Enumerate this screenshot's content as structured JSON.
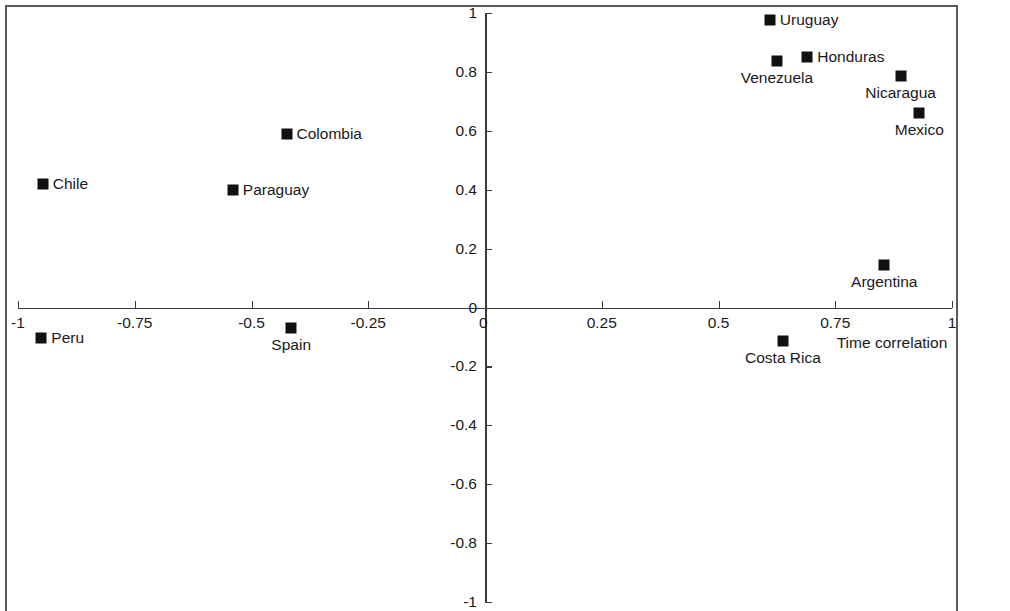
{
  "chart_data": {
    "type": "scatter",
    "title": "",
    "subtitle": "",
    "xlabel": "Time correlation",
    "ylabel": "",
    "xlim": [
      -1,
      1
    ],
    "ylim": [
      -1,
      1
    ],
    "grid": false,
    "legend": null,
    "xticks": [
      "-1",
      "-0.75",
      "-0.5",
      "-0.25",
      "0",
      "0.25",
      "0.5",
      "0.75",
      "1"
    ],
    "xtick_values": [
      -1,
      -0.75,
      -0.5,
      -0.25,
      0,
      0.25,
      0.5,
      0.75,
      1
    ],
    "yticks": [
      "1",
      "0.8",
      "0.6",
      "0.4",
      "0.2",
      "0",
      "-0.2",
      "-0.4",
      "-0.6",
      "-0.8",
      "-1"
    ],
    "ytick_values": [
      1,
      0.8,
      0.6,
      0.4,
      0.2,
      0,
      -0.2,
      -0.4,
      -0.6,
      -0.8,
      -1
    ],
    "points": [
      {
        "label": "Uruguay",
        "x": 0.61,
        "y": 0.975,
        "label_pos": "right"
      },
      {
        "label": "Honduras",
        "x": 0.69,
        "y": 0.852,
        "label_pos": "right"
      },
      {
        "label": "Venezuela",
        "x": 0.625,
        "y": 0.838,
        "label_pos": "below"
      },
      {
        "label": "Nicaragua",
        "x": 0.89,
        "y": 0.785,
        "label_pos": "below"
      },
      {
        "label": "Mexico",
        "x": 0.93,
        "y": 0.662,
        "label_pos": "below"
      },
      {
        "label": "Colombia",
        "x": -0.425,
        "y": 0.59,
        "label_pos": "right"
      },
      {
        "label": "Chile",
        "x": -0.947,
        "y": 0.418,
        "label_pos": "right"
      },
      {
        "label": "Paraguay",
        "x": -0.54,
        "y": 0.398,
        "label_pos": "right"
      },
      {
        "label": "Argentina",
        "x": 0.855,
        "y": 0.143,
        "label_pos": "below"
      },
      {
        "label": "Spain",
        "x": -0.415,
        "y": -0.068,
        "label_pos": "below"
      },
      {
        "label": "Peru",
        "x": -0.95,
        "y": -0.105,
        "label_pos": "right"
      },
      {
        "label": "Costa Rica",
        "x": 0.638,
        "y": -0.115,
        "label_pos": "below"
      }
    ]
  },
  "colors": {
    "marker": "#111111",
    "axis": "#3a3a3a",
    "text": "#1a1a1a",
    "frame": "#5a5a5a",
    "background": "#ffffff"
  }
}
